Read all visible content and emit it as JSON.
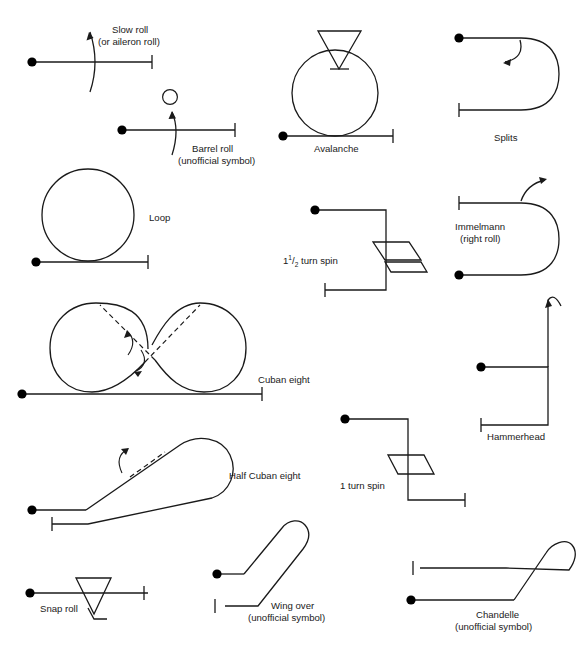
{
  "figure": {
    "line_color": "#1a1a1a",
    "background_color": "#ffffff",
    "symbol_count": 14
  },
  "symbols": {
    "slow_roll": {
      "name": "slow-roll",
      "label_line1": "Slow roll",
      "label_line2": "(or aileron roll)",
      "unofficial": false
    },
    "barrel_roll": {
      "name": "barrel-roll",
      "label_line1": "Barrel roll",
      "label_line2": "(unofficial symbol)",
      "unofficial": true
    },
    "avalanche": {
      "name": "avalanche",
      "label_line1": "Avalanche",
      "label_line2": "",
      "unofficial": false
    },
    "splits": {
      "name": "splits",
      "label_line1": "Splits",
      "label_line2": "",
      "unofficial": false
    },
    "loop": {
      "name": "loop",
      "label_line1": "Loop",
      "label_line2": "",
      "unofficial": false
    },
    "spin_one_and_half": {
      "name": "one-and-a-half-turn-spin",
      "label_whole": "1",
      "label_frac_num": "1",
      "label_frac_den": "2",
      "label_tail": " turn spin",
      "label_line1": "1½ turn spin",
      "label_line2": "",
      "unofficial": false
    },
    "immelmann": {
      "name": "immelmann",
      "label_line1": "Immelmann",
      "label_line2": "(right roll)",
      "unofficial": false
    },
    "cuban_eight": {
      "name": "cuban-eight",
      "label_line1": "Cuban eight",
      "label_line2": "",
      "unofficial": false
    },
    "hammerhead": {
      "name": "hammerhead",
      "label_line1": "Hammerhead",
      "label_line2": "",
      "unofficial": false
    },
    "half_cuban_eight": {
      "name": "half-cuban-eight",
      "label_line1": "Half Cuban eight",
      "label_line2": "",
      "unofficial": false
    },
    "spin_one_turn": {
      "name": "one-turn-spin",
      "label_line1": "1 turn spin",
      "label_line2": "",
      "unofficial": false
    },
    "snap_roll": {
      "name": "snap-roll",
      "label_line1": "Snap roll",
      "label_line2": "",
      "unofficial": false
    },
    "wing_over": {
      "name": "wing-over",
      "label_line1": "Wing over",
      "label_line2": "(unofficial symbol)",
      "unofficial": true
    },
    "chandelle": {
      "name": "chandelle",
      "label_line1": "Chandelle",
      "label_line2": "(unofficial symbol)",
      "unofficial": true
    }
  }
}
